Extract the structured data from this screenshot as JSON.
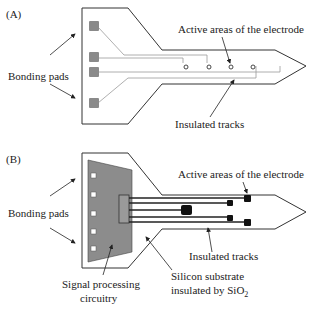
{
  "panel_a": {
    "label": "(A)",
    "bonding_pads_label": "Bonding pads",
    "active_areas_label": "Active areas of the electrode",
    "insulated_tracks_label": "Insulated tracks"
  },
  "panel_b": {
    "label": "(B)",
    "bonding_pads_label": "Bonding pads",
    "active_areas_label": "Active areas of the electrode",
    "insulated_tracks_label": "Insulated tracks",
    "signal_processing_label_line1": "Signal processing",
    "signal_processing_label_line2": "circuitry",
    "substrate_label_line1": "Silicon substrate",
    "substrate_label_line2": "insulated by SiO",
    "substrate_label_subscript": "2"
  },
  "colors": {
    "outline": "#333333",
    "pad_fill": "#8a8a8a",
    "track_a": "#9a9a9a",
    "circuit_fill": "#8c8c8c",
    "track_b": "#222222",
    "electrode_b": "#111111"
  }
}
